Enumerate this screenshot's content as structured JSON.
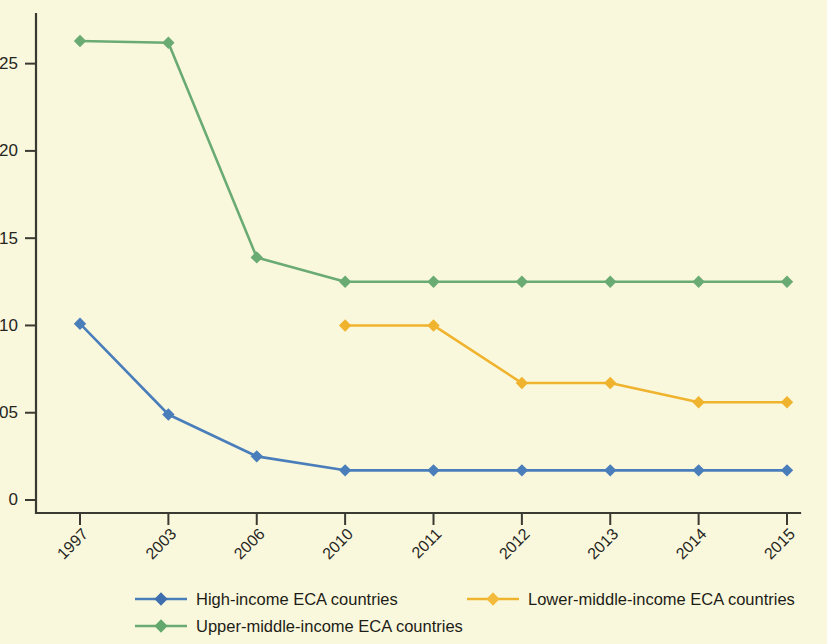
{
  "chart_data": {
    "type": "line",
    "title": "",
    "subtitle": "",
    "xlabel": "",
    "ylabel": "",
    "categories": [
      "1997",
      "2003",
      "2006",
      "2010",
      "2011",
      "2012",
      "2013",
      "2014",
      "2015"
    ],
    "x_tick_labels": [
      "1997",
      "2003",
      "2006",
      "2010",
      "2011",
      "2012",
      "2013",
      "2014",
      "2015"
    ],
    "y_tick_labels": [
      "0",
      "0.05",
      "0.10",
      "0.15",
      "0.20",
      "0.25"
    ],
    "y_tick_values": [
      0,
      0.05,
      0.1,
      0.15,
      0.2,
      0.25
    ],
    "ylim": [
      0,
      0.275
    ],
    "grid": false,
    "legend_position": "bottom",
    "marker": "diamond",
    "series": [
      {
        "name": "High-income ECA countries",
        "color": "#4a7ebb",
        "x": [
          "1997",
          "2003",
          "2006",
          "2010",
          "2011",
          "2012",
          "2013",
          "2014",
          "2015"
        ],
        "values": [
          0.101,
          0.049,
          0.025,
          0.017,
          0.017,
          0.017,
          0.017,
          0.017,
          0.017
        ]
      },
      {
        "name": "Lower-middle-income ECA countries",
        "color": "#efb32e",
        "x": [
          "2010",
          "2011",
          "2012",
          "2013",
          "2014",
          "2015"
        ],
        "values": [
          0.1,
          0.1,
          0.067,
          0.067,
          0.056,
          0.056
        ]
      },
      {
        "name": "Upper-middle-income ECA countries",
        "color": "#6aab73",
        "x": [
          "1997",
          "2003",
          "2006",
          "2010",
          "2011",
          "2012",
          "2013",
          "2014",
          "2015"
        ],
        "values": [
          0.263,
          0.262,
          0.139,
          0.125,
          0.125,
          0.125,
          0.125,
          0.125,
          0.125
        ]
      }
    ]
  },
  "legend": {
    "entries": [
      {
        "label": "High-income ECA countries",
        "color": "#4a7ebb"
      },
      {
        "label": "Lower-middle-income ECA countries",
        "color": "#efb32e"
      },
      {
        "label": "Upper-middle-income ECA countries",
        "color": "#6aab73"
      }
    ]
  },
  "colors": {
    "background": "#faf8dc",
    "axis": "#3a3a32",
    "text": "#26261f",
    "high_income": "#4a7ebb",
    "lower_middle_income": "#efb32e",
    "upper_middle_income": "#6aab73"
  }
}
